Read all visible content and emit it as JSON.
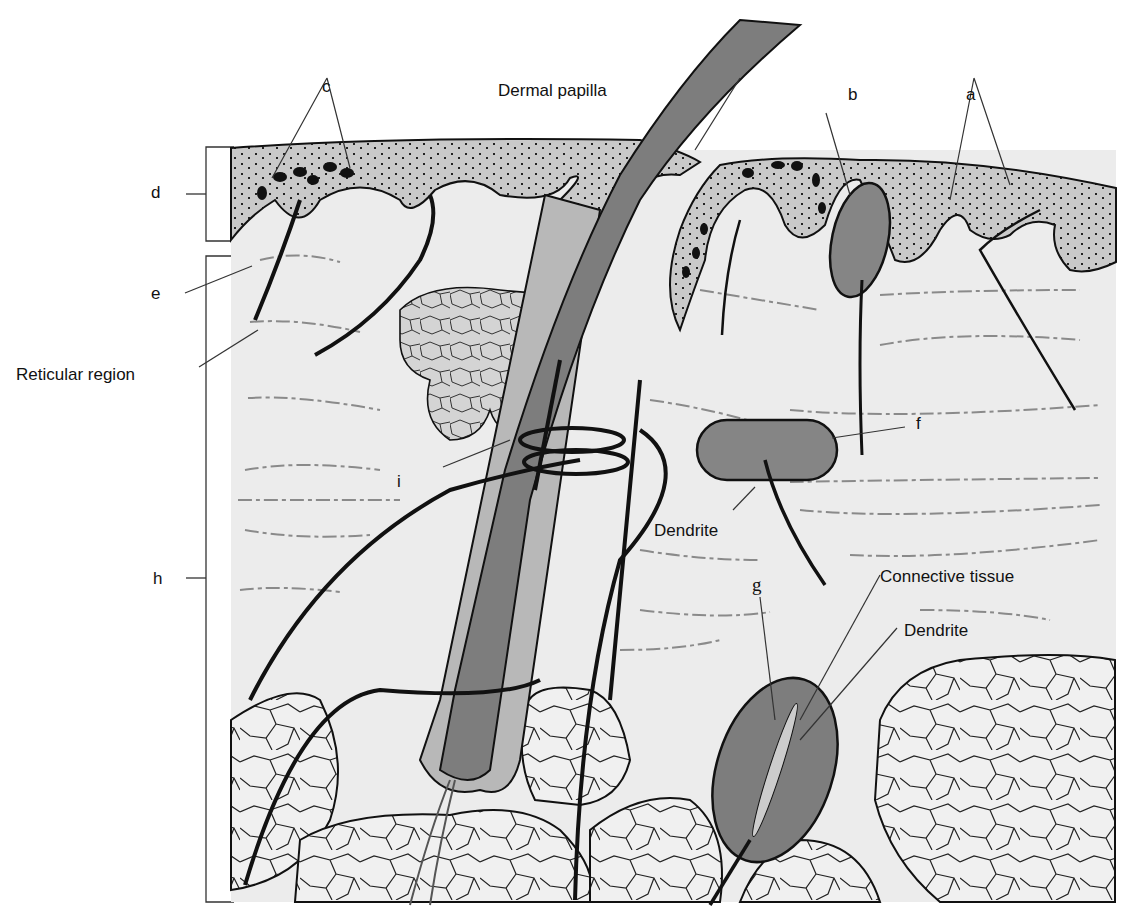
{
  "figure": {
    "type": "anatomical-diagram",
    "colors": {
      "epidermis": "#c9c9c9",
      "dermis": "#ececec",
      "hair_shaft": "#7d7d7d",
      "receptor_capsule": "#858585",
      "hypodermis_fat": "#f0f0f0",
      "outline": "#111111"
    }
  },
  "labels": {
    "c": "c",
    "dermal_papilla": "Dermal papilla",
    "b": "b",
    "a": "a",
    "d": "d",
    "e": "e",
    "reticular_region": "Reticular region",
    "i": "i",
    "f": "f",
    "dendrite_1": "Dendrite",
    "h": "h",
    "g": "g",
    "connective_tissue": "Connective tissue",
    "dendrite_2": "Dendrite"
  }
}
